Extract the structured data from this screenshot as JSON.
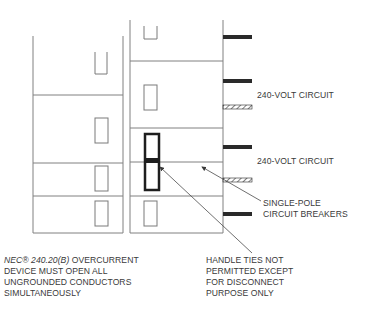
{
  "colors": {
    "line": "#7a7a7a",
    "panel_line": "#808080",
    "breaker_bar": "#2a2a2a",
    "handle_tie": "#1e1e1e",
    "text": "#3a3a3a",
    "background": "#ffffff"
  },
  "panel_left": {
    "frame": {
      "x1": 33,
      "x2": 123,
      "top": 36,
      "bottom": 233
    },
    "rows_y": [
      95,
      163,
      196
    ],
    "slots": [
      {
        "x": 95,
        "y": 52,
        "w": 12,
        "h": 22,
        "open_top": true
      },
      {
        "x": 95,
        "y": 118,
        "w": 13,
        "h": 25
      },
      {
        "x": 95,
        "y": 166,
        "w": 13,
        "h": 25
      },
      {
        "x": 95,
        "y": 201,
        "w": 13,
        "h": 25
      }
    ]
  },
  "panel_right": {
    "frame": {
      "x1": 130,
      "x2": 223,
      "top": 20,
      "bottom": 233
    },
    "rows_y": [
      61,
      128,
      162,
      196
    ],
    "slots": [
      {
        "x": 144,
        "y": 26,
        "w": 13,
        "h": 13,
        "open_top": true
      },
      {
        "x": 144,
        "y": 85,
        "w": 13,
        "h": 25
      },
      {
        "x": 144,
        "y": 201,
        "w": 13,
        "h": 25
      }
    ],
    "handle_tie": {
      "x": 145,
      "y": 134,
      "w": 14,
      "h": 56,
      "bar_y": 158,
      "bar_h": 5
    }
  },
  "bus_bars": [
    {
      "x": 223,
      "y": 35,
      "w": 29,
      "h": 4,
      "style": "solid"
    },
    {
      "x": 223,
      "y": 79,
      "w": 29,
      "h": 4,
      "style": "solid"
    },
    {
      "x": 223,
      "y": 105,
      "w": 29,
      "h": 4,
      "style": "hatched"
    },
    {
      "x": 223,
      "y": 145,
      "w": 29,
      "h": 4,
      "style": "solid"
    },
    {
      "x": 223,
      "y": 178,
      "w": 29,
      "h": 4,
      "style": "hatched"
    },
    {
      "x": 223,
      "y": 212,
      "w": 29,
      "h": 4,
      "style": "solid"
    }
  ],
  "leaders": [
    {
      "from": [
        261,
        201
      ],
      "to": [
        202,
        167
      ],
      "arrow": true
    },
    {
      "from": [
        252,
        253
      ],
      "to": [
        160,
        167
      ],
      "arrow": true
    }
  ],
  "labels": {
    "circuit_240_a": "240-VOLT CIRCUIT",
    "circuit_240_b": "240-VOLT CIRCUIT",
    "single_pole": [
      "SINGLE-POLE",
      "CIRCUIT BREAKERS"
    ],
    "nec_ref": "NEC® 240.20(B)",
    "nec_note": [
      "OVERCURRENT",
      "DEVICE MUST OPEN ALL",
      "UNGROUNDED CONDUCTORS",
      "SIMULTANEOUSLY"
    ],
    "handle_ties": [
      "HANDLE TIES NOT",
      "PERMITTED EXCEPT",
      "FOR DISCONNECT",
      "PURPOSE ONLY"
    ]
  }
}
